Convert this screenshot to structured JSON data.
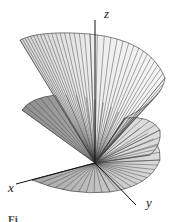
{
  "figure": {
    "type": "3d-surface-plot",
    "axes": {
      "x_label": "x",
      "y_label": "y",
      "z_label": "z"
    },
    "caption_fragment": "Fi",
    "colors": {
      "background": "#ffffff",
      "surface_light": "#e6e6e6",
      "surface_mid": "#c8c8c8",
      "surface_dark": "#9a9a9a",
      "rulings": "#333333",
      "axes": "#111111"
    }
  }
}
